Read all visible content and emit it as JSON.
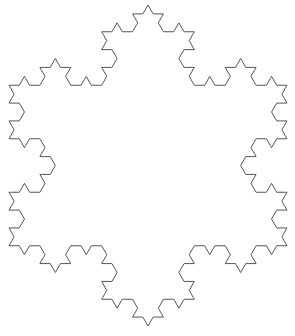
{
  "figure": {
    "type": "koch-snowflake",
    "iterations": 3,
    "center": [
      148,
      165.5
    ],
    "side_length": 278,
    "orientation": "vertex-up",
    "stroke_color": "#555555",
    "stroke_width": 1,
    "background": "#ffffff"
  }
}
